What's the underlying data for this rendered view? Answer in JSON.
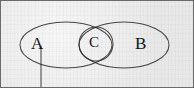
{
  "figure": {
    "background_color": "#ececec",
    "ink_color": "#2a2a2a",
    "frame_color": "#6a6a6a",
    "width": 194,
    "height": 88
  },
  "labels": {
    "set_a": "A",
    "set_c": "C",
    "set_b": "B"
  },
  "shapes": {
    "ellipse_a": {
      "name": "ellipse-a",
      "cx": 66,
      "cy": 45,
      "rx": 46,
      "ry": 23
    },
    "ellipse_b": {
      "name": "ellipse-b",
      "cx": 124,
      "cy": 45,
      "rx": 45,
      "ry": 23
    },
    "circle_c": {
      "name": "circle-c",
      "cx": 96,
      "cy": 44,
      "r": 17
    },
    "leader_line": {
      "name": "leader-line",
      "x": 41,
      "y1": 46,
      "y2": 88
    }
  }
}
